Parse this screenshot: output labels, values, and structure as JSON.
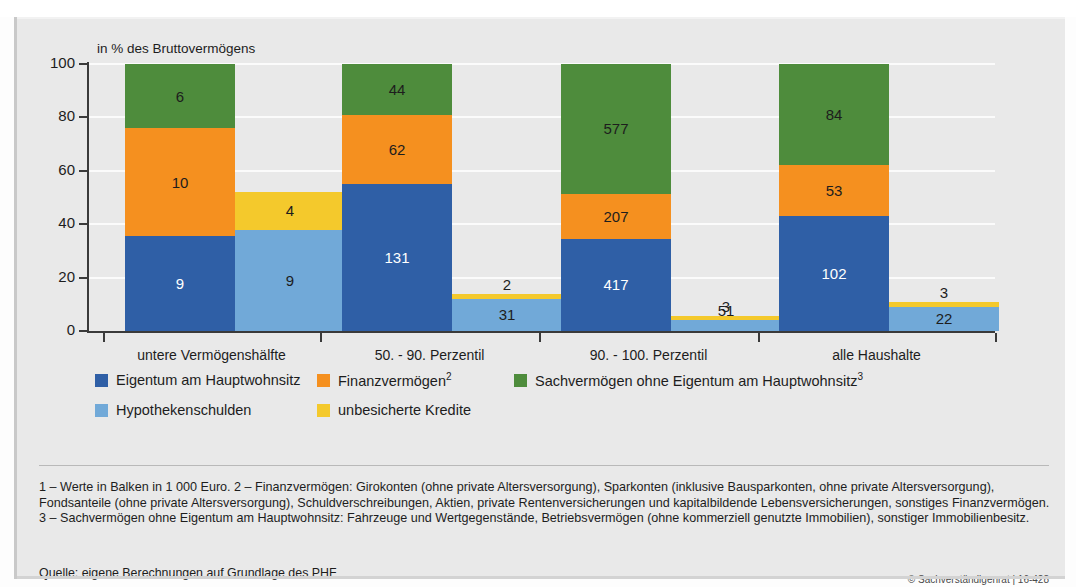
{
  "figure": {
    "cut_title": "",
    "axis_unit_label": "in % des Bruttovermögens",
    "source": "Quelle: eigene Berechnungen auf Grundlage des PHF",
    "copyright": "© Sachverständigenrat | 16-428",
    "footnote": "1 – Werte in Balken in 1 000 Euro.  2 – Finanzvermögen: Girokonten (ohne private Altersversorgung), Sparkonten (inklusive Bausparkonten, ohne private Altersversorgung), Fondsanteile (ohne private Altersversorgung), Schuldverschreibungen, Aktien, private Rentenversicherungen und kapitalbildende Lebensversicherungen, sonstiges Finanzvermögen.  3 – Sachvermögen ohne Eigentum am Hauptwohnsitz: Fahrzeuge und Wertgegenstände, Betriebsvermögen (ohne kommerziell genutzte Immobilien), sonstiger Immobilienbesitz."
  },
  "colors": {
    "eigentum_blue": "#2f5fa6",
    "finanz_orange": "#f5901f",
    "sach_green": "#4e8c3c",
    "hypo_lightblue": "#71a9d8",
    "kredit_yellow": "#f4c92c",
    "panel_bg": "#e9e9e9",
    "gridline": "#fbfbfb",
    "axis": "#3a3a3a"
  },
  "legend": {
    "row1": [
      {
        "label": "Eigentum am Hauptwohnsitz",
        "sup": "",
        "color": "#2f5fa6"
      },
      {
        "label": "Finanzvermögen",
        "sup": "2",
        "color": "#f5901f"
      },
      {
        "label": "Sachvermögen ohne Eigentum am Hauptwohnsitz",
        "sup": "3",
        "color": "#4e8c3c"
      }
    ],
    "row2": [
      {
        "label": "Hypothekenschulden",
        "sup": "",
        "color": "#71a9d8"
      },
      {
        "label": "unbesicherte Kredite",
        "sup": "",
        "color": "#f4c92c"
      }
    ]
  },
  "chart_data": {
    "type": "bar",
    "subtype": "stacked-bar-grouped",
    "title": "",
    "xlabel": "",
    "ylabel": "in % des Bruttovermögens",
    "ylim": [
      0,
      100
    ],
    "yticks": [
      0,
      20,
      40,
      60,
      80,
      100
    ],
    "grid": true,
    "legend_position": "bottom",
    "value_unit": "1 000 Euro",
    "categories": [
      "untere Vermögenshälfte",
      "50. - 90. Perzentil",
      "90. - 100. Perzentil",
      "alle Haushalte"
    ],
    "series": [
      {
        "name": "Eigentum am Hauptwohnsitz",
        "stack": "assets",
        "color": "#2f5fa6",
        "label_color": "#ffffff",
        "percent": [
          35.5,
          55.0,
          34.5,
          43.0
        ],
        "values": [
          9,
          131,
          417,
          102
        ]
      },
      {
        "name": "Finanzvermögen",
        "stack": "assets",
        "color": "#f5901f",
        "label_color": "#1d1d1d",
        "percent": [
          40.5,
          26.0,
          17.0,
          19.0
        ],
        "values": [
          10,
          62,
          207,
          53
        ]
      },
      {
        "name": "Sachvermögen ohne Eigentum am Hauptwohnsitz",
        "stack": "assets",
        "color": "#4e8c3c",
        "label_color": "#1d1d1d",
        "percent": [
          24.0,
          19.0,
          48.5,
          38.0
        ],
        "values": [
          6,
          44,
          577,
          84
        ]
      },
      {
        "name": "Hypothekenschulden",
        "stack": "debts",
        "color": "#71a9d8",
        "label_color": "#1d1d1d",
        "percent": [
          38.0,
          12.0,
          4.0,
          9.0
        ],
        "values": [
          9,
          31,
          51,
          22
        ]
      },
      {
        "name": "unbesicherte Kredite",
        "stack": "debts",
        "color": "#f4c92c",
        "label_color": "#1d1d1d",
        "percent": [
          14.0,
          2.0,
          1.5,
          2.0
        ],
        "values": [
          4,
          2,
          3,
          3
        ]
      }
    ]
  }
}
